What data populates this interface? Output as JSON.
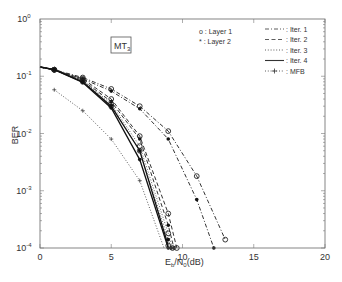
{
  "chart_data": {
    "type": "line",
    "title": "",
    "annotation": "MT3",
    "annotation_main": "MT",
    "annotation_sub": "3",
    "xlabel_main": "E",
    "xlabel_sub1": "b",
    "xlabel_mid": "/N",
    "xlabel_sub2": "0",
    "xlabel_tail": "(dB)",
    "ylabel": "BER",
    "xlim": [
      0,
      20
    ],
    "ylim": [
      0.0001,
      1
    ],
    "yscale": "log",
    "xticks": [
      0,
      5,
      10,
      15,
      20
    ],
    "yticks": [
      {
        "base": "10",
        "exp": "0",
        "value": 1
      },
      {
        "base": "10",
        "exp": "-1",
        "value": 0.1
      },
      {
        "base": "10",
        "exp": "-2",
        "value": 0.01
      },
      {
        "base": "10",
        "exp": "-3",
        "value": 0.001
      },
      {
        "base": "10",
        "exp": "-4",
        "value": 0.0001
      }
    ],
    "legend_markers": [
      {
        "symbol": "o",
        "label": "o : Layer 1"
      },
      {
        "symbol": "*",
        "label": "* : Layer 2"
      }
    ],
    "legend_lines": [
      {
        "style": "dashdot",
        "label": ": Iter. 1"
      },
      {
        "style": "dashed",
        "label": ": Iter. 2"
      },
      {
        "style": "dotted",
        "label": ": Iter. 3"
      },
      {
        "style": "solid",
        "label": ": Iter. 4"
      },
      {
        "style": "dotted-star",
        "label": ": MFB"
      }
    ],
    "series": [
      {
        "name": "Iter. 1 Layer 1",
        "style": "dashdot",
        "marker": "o",
        "x": [
          0,
          1,
          3,
          5,
          7,
          9,
          11,
          13
        ],
        "y": [
          0.145,
          0.13,
          0.095,
          0.06,
          0.03,
          0.011,
          0.0018,
          0.00014
        ]
      },
      {
        "name": "Iter. 1 Layer 2",
        "style": "dashdot",
        "marker": "*",
        "x": [
          0,
          1,
          3,
          5,
          7,
          9,
          11,
          12.2
        ],
        "y": [
          0.145,
          0.13,
          0.09,
          0.055,
          0.027,
          0.008,
          0.0007,
          0.0001
        ]
      },
      {
        "name": "Iter. 2 Layer 1",
        "style": "dashed",
        "marker": "o",
        "x": [
          0,
          1,
          3,
          5,
          7,
          9,
          9.6
        ],
        "y": [
          0.145,
          0.13,
          0.09,
          0.04,
          0.009,
          0.0004,
          0.0001
        ]
      },
      {
        "name": "Iter. 2 Layer 2",
        "style": "dashed",
        "marker": "*",
        "x": [
          0,
          1,
          3,
          5,
          7,
          9,
          9.4
        ],
        "y": [
          0.145,
          0.13,
          0.085,
          0.036,
          0.008,
          0.00025,
          0.0001
        ]
      },
      {
        "name": "Iter. 3 Layer 1",
        "style": "dotted",
        "marker": "o",
        "x": [
          0,
          1,
          3,
          5,
          7,
          9,
          9.3
        ],
        "y": [
          0.145,
          0.13,
          0.085,
          0.033,
          0.006,
          0.00018,
          0.0001
        ]
      },
      {
        "name": "Iter. 3 Layer 2",
        "style": "dotted",
        "marker": "*",
        "x": [
          0,
          1,
          3,
          5,
          7,
          9,
          9.2
        ],
        "y": [
          0.145,
          0.13,
          0.083,
          0.031,
          0.005,
          0.00014,
          0.0001
        ]
      },
      {
        "name": "Iter. 4 Layer 1",
        "style": "solid",
        "marker": "o",
        "x": [
          0,
          1,
          3,
          5,
          7,
          9
        ],
        "y": [
          0.145,
          0.13,
          0.08,
          0.03,
          0.005,
          0.00011
        ]
      },
      {
        "name": "Iter. 4 Layer 2",
        "style": "solid",
        "marker": "*",
        "x": [
          0,
          1,
          3,
          5,
          7,
          9
        ],
        "y": [
          0.145,
          0.13,
          0.078,
          0.028,
          0.0035,
          0.0001
        ]
      },
      {
        "name": "MFB",
        "style": "dotted",
        "marker": "+",
        "x": [
          1,
          3,
          5,
          7,
          8.7
        ],
        "y": [
          0.058,
          0.025,
          0.008,
          0.0015,
          0.0001
        ]
      }
    ],
    "grid": false,
    "legend_position": "upper right"
  }
}
